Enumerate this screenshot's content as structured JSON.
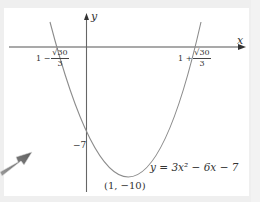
{
  "figure": {
    "type": "parabola-sketch",
    "equation": "y = 3x² − 6x − 7",
    "axes": {
      "x_label": "x",
      "y_label": "y"
    },
    "roots": [
      {
        "prefix": "1 −",
        "numerator": "√30",
        "denominator": "3"
      },
      {
        "prefix": "1 +",
        "numerator": "√30",
        "denominator": "3"
      }
    ],
    "y_intercept_label": "−7",
    "vertex_label": "(1, −10)",
    "colors": {
      "background": "#efefef",
      "panel": "#ffffff",
      "axis": "#555555",
      "curve": "#8c8c8c",
      "arrow": "#7a7a7a"
    }
  }
}
